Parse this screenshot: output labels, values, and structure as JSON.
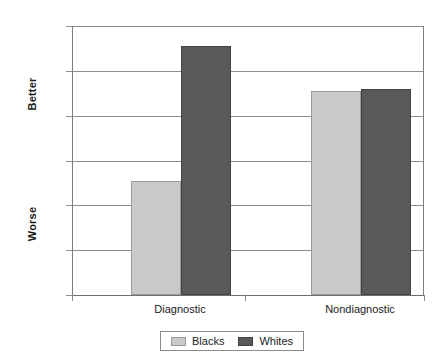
{
  "chart_data": {
    "type": "bar",
    "title": "",
    "xlabel": "",
    "ylabel": "",
    "categories": [
      "Diagnostic",
      "Nondiagnostic"
    ],
    "series": [
      {
        "name": "Blacks",
        "color": "#c9c9c9",
        "values": [
          5.1,
          9.1
        ]
      },
      {
        "name": "Whites",
        "color": "#58595b",
        "values": [
          11.1,
          9.2
        ]
      }
    ],
    "ylim": [
      0,
      12
    ],
    "yticks": [
      0,
      2,
      4,
      6,
      8,
      10,
      12
    ],
    "ytick_labels": [
      "0",
      "2",
      "4",
      "6",
      "8",
      "10",
      "12"
    ],
    "y_axis_anchor_high": "Better",
    "y_axis_anchor_low": "Worse",
    "grid": true,
    "legend_position": "bottom-center"
  },
  "axis_titles": {
    "better": "Better",
    "worse": "Worse"
  },
  "legend": {
    "entries": [
      {
        "label": "Blacks",
        "swatch": "light"
      },
      {
        "label": "Whites",
        "swatch": "dark"
      }
    ]
  }
}
